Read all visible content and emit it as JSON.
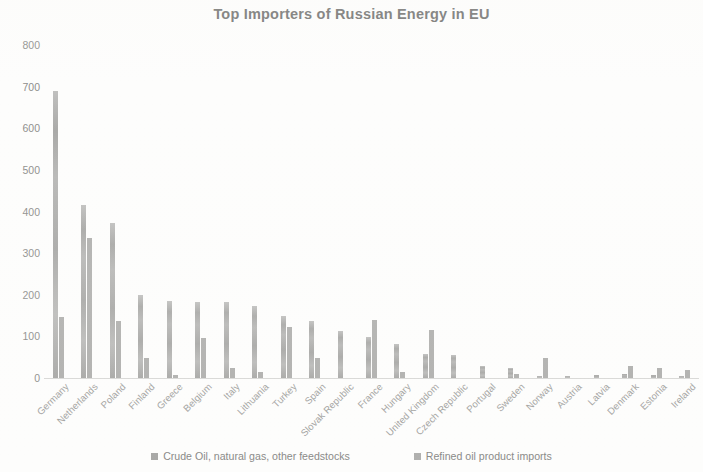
{
  "chart_data": {
    "type": "bar",
    "title": "Top Importers of Russian Energy in EU",
    "xlabel": "",
    "ylabel": "",
    "ylim": [
      0,
      800
    ],
    "yticks": [
      0,
      100,
      200,
      300,
      400,
      500,
      600,
      700,
      800
    ],
    "grid": false,
    "legend_position": "bottom",
    "categories": [
      "Germany",
      "Netherlands",
      "Poland",
      "Finland",
      "Greece",
      "Belgium",
      "Italy",
      "Lithuania",
      "Turkey",
      "Spain",
      "Slovak Republic",
      "France",
      "Hungary",
      "United Kingdom",
      "Czech Republic",
      "Portugal",
      "Sweden",
      "Norway",
      "Austria",
      "Latvia",
      "Denmark",
      "Estonia",
      "Ireland"
    ],
    "series": [
      {
        "name": "Crude Oil, natural gas, other feedstocks",
        "color": "#a8a8a6",
        "values": [
          690,
          415,
          373,
          200,
          185,
          182,
          182,
          172,
          148,
          138,
          113,
          98,
          81,
          58,
          55,
          30,
          25,
          5,
          5,
          8,
          10,
          8,
          5
        ]
      },
      {
        "name": "Refined oil product imports",
        "color": "#b0b0ae",
        "values": [
          147,
          337,
          138,
          47,
          8,
          97,
          23,
          15,
          122,
          48,
          0,
          140,
          15,
          115,
          0,
          0,
          10,
          48,
          0,
          0,
          28,
          25,
          20
        ]
      }
    ]
  },
  "colors": {
    "series1": "#a8a8a6",
    "series2": "#b0b0ae",
    "text": "#8a8a88",
    "title": "#6e6e6c",
    "background": "#fdfdfc"
  }
}
